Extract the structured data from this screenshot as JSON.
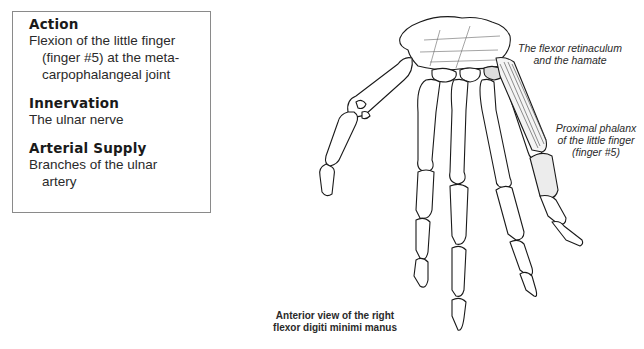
{
  "info_box": {
    "sections": [
      {
        "heading": "Action",
        "lines": [
          "Flexion of the little finger",
          "(finger #5) at the meta-",
          "carpophalangeal joint"
        ]
      },
      {
        "heading": "Innervation",
        "lines": [
          "The ulnar nerve"
        ]
      },
      {
        "heading": "Arterial Supply",
        "lines": [
          "Branches of the ulnar",
          "artery"
        ]
      }
    ]
  },
  "labels": {
    "origin": [
      "The flexor retinaculum",
      "and the hamate"
    ],
    "insertion": [
      "Proximal phalanx",
      "of the little finger",
      "(finger #5)"
    ]
  },
  "caption": [
    "Anterior view of the right",
    "flexor digiti minimi manus"
  ],
  "colors": {
    "line": "#1a1a1a",
    "border": "#8a8a8a",
    "bone_fill": "#ffffff"
  }
}
